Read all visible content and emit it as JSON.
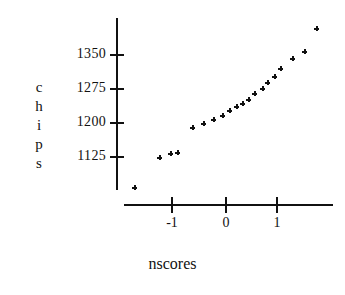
{
  "chart_data": {
    "type": "scatter",
    "title": "",
    "subtitle": "",
    "xlabel": "nscores",
    "ylabel": "chips",
    "ylabel_letters": [
      "c",
      "h",
      "i",
      "p",
      "s"
    ],
    "x": [
      -1.73,
      -1.25,
      -1.05,
      -0.92,
      -0.62,
      -0.42,
      -0.23,
      -0.05,
      0.08,
      0.2,
      0.33,
      0.43,
      0.55,
      0.7,
      0.8,
      0.93,
      1.05,
      1.28,
      1.5,
      1.73
    ],
    "y": [
      1058,
      1125,
      1133,
      1136,
      1190,
      1198,
      1207,
      1216,
      1227,
      1236,
      1243,
      1252,
      1265,
      1277,
      1290,
      1302,
      1320,
      1342,
      1358,
      1408
    ],
    "xlim": [
      -2.0,
      2.0
    ],
    "ylim": [
      1020,
      1420
    ],
    "xticks": [
      -1,
      0,
      1
    ],
    "xtick_labels": [
      "-1",
      "0",
      "1"
    ],
    "yticks": [
      1125,
      1200,
      1275,
      1350
    ],
    "ytick_labels": [
      "1125",
      "1200",
      "1275",
      "1350"
    ],
    "grid": false,
    "legend": false,
    "marker": "plus",
    "marker_color": "#111111",
    "axis_color": "#111111",
    "background": "#ffffff"
  },
  "axes": {
    "y_title": "chips",
    "x_title": "nscores"
  }
}
